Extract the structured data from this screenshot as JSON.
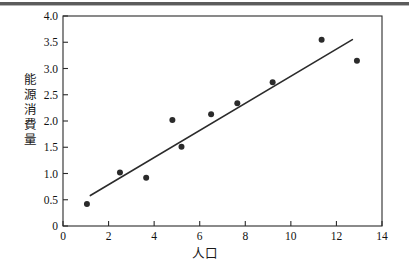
{
  "figure": {
    "name": "scatter-plot-population-vs-energy",
    "background_color": "#ffffff",
    "page_rule_color": "#5c5c5c"
  },
  "axis_titles": {
    "y": "能\n源\n消\n費\n量",
    "x": "人口"
  },
  "chart_data": {
    "type": "scatter",
    "title": "",
    "xlabel": "人口",
    "ylabel": "能源消費量",
    "xlim": [
      0,
      14
    ],
    "ylim": [
      0,
      4.0
    ],
    "xticks": [
      0,
      2,
      4,
      6,
      8,
      10,
      12,
      14
    ],
    "xtick_labels": [
      "0",
      "2",
      "4",
      "6",
      "8",
      "10",
      "12",
      "14"
    ],
    "yticks": [
      0,
      0.5,
      1.0,
      1.5,
      2.0,
      2.5,
      3.0,
      3.5,
      4.0
    ],
    "ytick_labels": [
      "0",
      "0.5",
      "1.0",
      "1.5",
      "2.0",
      "2.5",
      "3.0",
      "3.5",
      "4.0"
    ],
    "grid": false,
    "legend": null,
    "marker_color": "#2b2b2b",
    "marker_size": 4.2,
    "line_color": "#2b2b2b",
    "points": [
      {
        "x": 1.05,
        "y": 0.42
      },
      {
        "x": 2.5,
        "y": 1.02
      },
      {
        "x": 3.65,
        "y": 0.92
      },
      {
        "x": 4.8,
        "y": 2.02
      },
      {
        "x": 5.2,
        "y": 1.51
      },
      {
        "x": 6.5,
        "y": 2.13
      },
      {
        "x": 7.65,
        "y": 2.34
      },
      {
        "x": 9.2,
        "y": 2.74
      },
      {
        "x": 11.35,
        "y": 3.55
      },
      {
        "x": 12.9,
        "y": 3.15
      }
    ],
    "fit_line": {
      "name": "regression-line",
      "x_start": 1.2,
      "y_start": 0.58,
      "x_end": 12.7,
      "y_end": 3.55
    }
  }
}
